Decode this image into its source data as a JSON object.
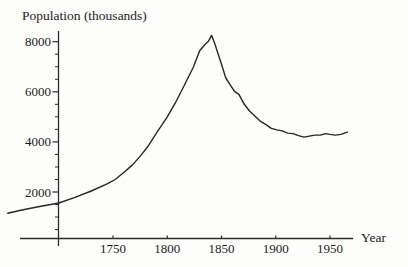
{
  "colors": {
    "line": "#262626",
    "axis": "#2b2b2b",
    "text": "#1c1c1c",
    "background": "#fdfdfb"
  },
  "chart_data": {
    "type": "line",
    "title": "",
    "ylabel": "Population (thousands)",
    "xlabel": "Year",
    "x_ticks": [
      1750,
      1800,
      1850,
      1900,
      1950
    ],
    "y_ticks": [
      2000,
      4000,
      6000,
      8000
    ],
    "y_minor_step": 500,
    "xlim": [
      1645,
      1975
    ],
    "ylim": [
      0,
      8600
    ],
    "grid": false,
    "legend": "none",
    "series": [
      {
        "name": "population",
        "points": [
          [
            1653,
            1150
          ],
          [
            1665,
            1270
          ],
          [
            1680,
            1400
          ],
          [
            1700,
            1560
          ],
          [
            1715,
            1790
          ],
          [
            1730,
            2040
          ],
          [
            1745,
            2330
          ],
          [
            1752,
            2500
          ],
          [
            1760,
            2780
          ],
          [
            1768,
            3080
          ],
          [
            1775,
            3420
          ],
          [
            1783,
            3870
          ],
          [
            1790,
            4350
          ],
          [
            1800,
            5000
          ],
          [
            1808,
            5600
          ],
          [
            1816,
            6280
          ],
          [
            1824,
            6980
          ],
          [
            1830,
            7650
          ],
          [
            1835,
            7900
          ],
          [
            1838,
            8020
          ],
          [
            1841,
            8250
          ],
          [
            1844,
            7900
          ],
          [
            1847,
            7500
          ],
          [
            1850,
            7100
          ],
          [
            1854,
            6550
          ],
          [
            1858,
            6280
          ],
          [
            1862,
            6020
          ],
          [
            1866,
            5900
          ],
          [
            1871,
            5500
          ],
          [
            1876,
            5220
          ],
          [
            1881,
            5020
          ],
          [
            1886,
            4820
          ],
          [
            1891,
            4690
          ],
          [
            1896,
            4540
          ],
          [
            1901,
            4480
          ],
          [
            1906,
            4440
          ],
          [
            1911,
            4350
          ],
          [
            1916,
            4330
          ],
          [
            1921,
            4250
          ],
          [
            1926,
            4190
          ],
          [
            1931,
            4230
          ],
          [
            1936,
            4270
          ],
          [
            1941,
            4270
          ],
          [
            1946,
            4330
          ],
          [
            1950,
            4300
          ],
          [
            1955,
            4270
          ],
          [
            1960,
            4300
          ],
          [
            1966,
            4390
          ]
        ]
      }
    ]
  }
}
